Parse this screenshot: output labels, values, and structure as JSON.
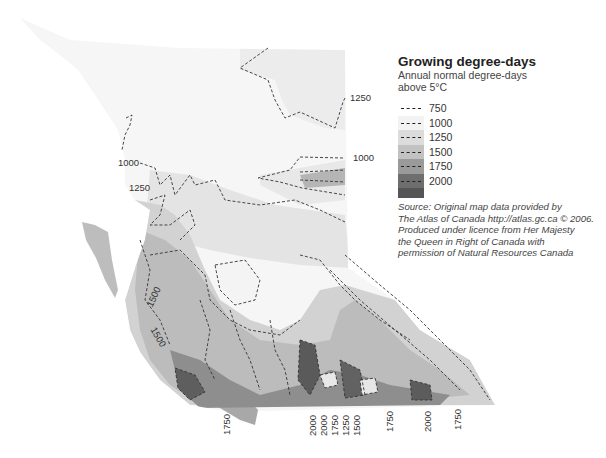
{
  "legend": {
    "title": "Growing degree-days",
    "subtitle_line1": "Annual normal degree-days",
    "subtitle_line2": "above 5°C",
    "items": [
      {
        "label": "750",
        "color": "#ffffff"
      },
      {
        "label": "1000",
        "color": "#f3f3f3"
      },
      {
        "label": "1250",
        "color": "#dcdcdc"
      },
      {
        "label": "1500",
        "color": "#c2c2c2"
      },
      {
        "label": "1750",
        "color": "#9a9a9a"
      },
      {
        "label": "2000",
        "color": "#6e6e6e"
      }
    ],
    "tail_color": "#555555"
  },
  "source": {
    "line1": "Source: Original map data provided by",
    "line2": "The Atlas of Canada http://atlas.gc.ca © 2006.",
    "line3": "Produced under licence from Her Majesty",
    "line4": "the Queen in Right of Canada with",
    "line5": "permission of Natural Resources Canada"
  },
  "contour_labels": {
    "ne_1250": "1250",
    "e_1000": "1000",
    "w_1000": "1000",
    "w_1250": "1250",
    "coast_1500_a": "1500",
    "coast_1500_b": "1500",
    "bottom": [
      "1750",
      "2000",
      "2000",
      "1750",
      "1250",
      "1500",
      "1750",
      "2000",
      "1750"
    ]
  }
}
